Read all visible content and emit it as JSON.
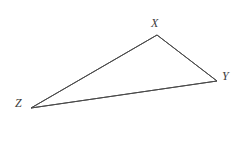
{
  "figure": {
    "type": "triangle-diagram",
    "width": 241,
    "height": 148,
    "background_color": "#ffffff",
    "stroke_color": "#4a4a4a",
    "stroke_width": 1,
    "label_color": "#3b3b3b"
  },
  "vertices": [
    {
      "id": "X",
      "label": "X",
      "x": 157,
      "y": 35,
      "label_x": 151,
      "label_y": 17
    },
    {
      "id": "Y",
      "label": "Y",
      "x": 217,
      "y": 81,
      "label_x": 222,
      "label_y": 70
    },
    {
      "id": "Z",
      "label": "Z",
      "x": 31,
      "y": 108,
      "label_x": 15,
      "label_y": 97
    }
  ],
  "edges": [
    {
      "id": "XY",
      "from": "X",
      "to": "Y",
      "points": "157,35 217,81"
    },
    {
      "id": "YZ",
      "from": "Y",
      "to": "Z",
      "points": "217,81 31,108"
    },
    {
      "id": "ZX",
      "from": "Z",
      "to": "X",
      "points": "31,108 157,35"
    }
  ],
  "polygon": {
    "points": "157,35 217,81 31,108"
  }
}
